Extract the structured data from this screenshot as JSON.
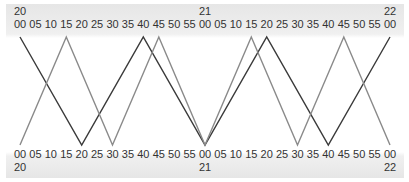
{
  "chart_data": {
    "type": "line",
    "title": "",
    "xlabel": "",
    "ylabel": "",
    "x_range": [
      "20:00",
      "22:00"
    ],
    "top_axis": {
      "hour_labels": [
        {
          "minute_offset": 0,
          "label": "20"
        },
        {
          "minute_offset": 60,
          "label": "21"
        },
        {
          "minute_offset": 120,
          "label": "22"
        }
      ],
      "minute_labels": [
        "00",
        "05",
        "10",
        "15",
        "20",
        "25",
        "30",
        "35",
        "40",
        "45",
        "50",
        "55",
        "00",
        "05",
        "10",
        "15",
        "20",
        "25",
        "30",
        "35",
        "40",
        "45",
        "50",
        "55",
        "00"
      ]
    },
    "bottom_axis": {
      "hour_labels": [
        {
          "minute_offset": 0,
          "label": "20"
        },
        {
          "minute_offset": 60,
          "label": "21"
        },
        {
          "minute_offset": 120,
          "label": "22"
        }
      ],
      "minute_labels": [
        "00",
        "05",
        "10",
        "15",
        "20",
        "25",
        "30",
        "35",
        "40",
        "45",
        "50",
        "55",
        "00",
        "05",
        "10",
        "15",
        "20",
        "25",
        "30",
        "35",
        "40",
        "45",
        "50",
        "55",
        "00"
      ]
    },
    "y_levels": {
      "top": 1,
      "bottom": 0
    },
    "grid": false,
    "legend": null,
    "series": [
      {
        "name": "line-dark",
        "color": "#3a3a3a",
        "points": [
          {
            "t": "20:00",
            "level": 1
          },
          {
            "t": "20:20",
            "level": 0
          },
          {
            "t": "20:40",
            "level": 1
          },
          {
            "t": "21:00",
            "level": 0
          },
          {
            "t": "21:20",
            "level": 1
          },
          {
            "t": "21:40",
            "level": 0
          },
          {
            "t": "22:00",
            "level": 1
          }
        ]
      },
      {
        "name": "line-gray",
        "color": "#8a8a8a",
        "points": [
          {
            "t": "20:00",
            "level": 0
          },
          {
            "t": "20:15",
            "level": 1
          },
          {
            "t": "20:30",
            "level": 0
          },
          {
            "t": "20:45",
            "level": 1
          },
          {
            "t": "21:00",
            "level": 0
          },
          {
            "t": "21:15",
            "level": 1
          },
          {
            "t": "21:30",
            "level": 0
          },
          {
            "t": "21:45",
            "level": 1
          },
          {
            "t": "22:00",
            "level": 0
          }
        ]
      }
    ]
  }
}
